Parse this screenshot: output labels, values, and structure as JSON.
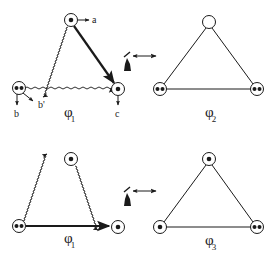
{
  "colors": {
    "ink": "#1a1a1a",
    "background": "#ffffff"
  },
  "panels": [
    {
      "id": "top-left",
      "phi_label": "φ",
      "phi_subscript": "1",
      "node_labels": {
        "a": "a",
        "b": "b",
        "b_prime": "b'",
        "c": "c"
      }
    },
    {
      "id": "top-right",
      "phi_label": "φ",
      "phi_subscript": "2"
    },
    {
      "id": "bottom-left",
      "phi_label": "φ",
      "phi_subscript": "1"
    },
    {
      "id": "bottom-right",
      "phi_label": "φ",
      "phi_subscript": "3"
    }
  ]
}
